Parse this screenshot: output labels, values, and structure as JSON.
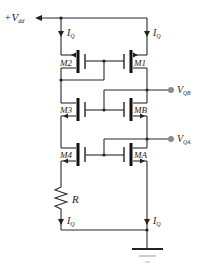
{
  "diagram": {
    "type": "circuit-schematic",
    "supply": {
      "label": "+V",
      "sub": "dd"
    },
    "currents": [
      {
        "id": "iq-top-left",
        "label": "I",
        "sub": "Q"
      },
      {
        "id": "iq-top-right",
        "label": "I",
        "sub": "Q"
      },
      {
        "id": "iq-bottom-left",
        "label": "I",
        "sub": "Q"
      },
      {
        "id": "iq-bottom-right",
        "label": "I",
        "sub": "Q"
      }
    ],
    "transistors": [
      {
        "id": "M2",
        "label": "M2",
        "type": "PMOS"
      },
      {
        "id": "M1",
        "label": "M1",
        "type": "PMOS"
      },
      {
        "id": "M3",
        "label": "M3",
        "type": "NMOS"
      },
      {
        "id": "MB",
        "label": "MB",
        "type": "NMOS"
      },
      {
        "id": "M4",
        "label": "M4",
        "type": "NMOS"
      },
      {
        "id": "MA",
        "label": "MA",
        "type": "NMOS"
      }
    ],
    "outputs": [
      {
        "id": "vqb",
        "label": "V",
        "sub": "QB"
      },
      {
        "id": "vqa",
        "label": "V",
        "sub": "QA"
      }
    ],
    "resistor": {
      "label": "R"
    },
    "ground": {
      "label": "ground"
    },
    "colors": {
      "wire": "#2a2a2a",
      "terminal": "#8c8c8c",
      "background": "#ffffff"
    }
  }
}
